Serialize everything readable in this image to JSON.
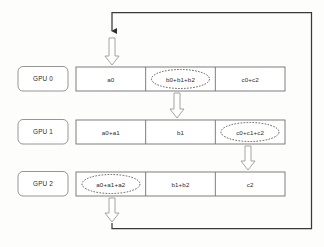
{
  "diagram": {
    "background_color": "#fdfdfc",
    "line_color": "#3a3a3a",
    "box_border_color": "#8a8a8a",
    "text_color": "#2b2b2b",
    "rows": [
      {
        "gpu_label": "GPU 0",
        "cells": [
          {
            "text": "a0",
            "highlighted": false
          },
          {
            "text": "b0+b1+b2",
            "highlighted": true
          },
          {
            "text": "c0+c2",
            "highlighted": false
          }
        ]
      },
      {
        "gpu_label": "GPU 1",
        "cells": [
          {
            "text": "a0+a1",
            "highlighted": false
          },
          {
            "text": "b1",
            "highlighted": false
          },
          {
            "text": "c0+c1+c2",
            "highlighted": true
          }
        ]
      },
      {
        "gpu_label": "GPU 2",
        "cells": [
          {
            "text": "a0+a1+a2",
            "highlighted": true
          },
          {
            "text": "b1+b2",
            "highlighted": false
          },
          {
            "text": "c2",
            "highlighted": false
          }
        ]
      }
    ],
    "arrows": [
      {
        "name": "block-arrow-into-gpu0",
        "x": 112,
        "y_top": 38,
        "y_bottom": 64
      },
      {
        "name": "block-arrow-gpu0-to-gpu1",
        "x": 177,
        "y_top": 93,
        "y_bottom": 118
      },
      {
        "name": "block-arrow-gpu1-to-gpu2",
        "x": 248,
        "y_top": 146,
        "y_bottom": 170
      },
      {
        "name": "block-arrow-gpu2-to-loop",
        "x": 112,
        "y_top": 198,
        "y_bottom": 222
      }
    ],
    "feedback_loop": {
      "name": "ring-feedback-loop",
      "path": "M112,222 L112,228 L312,228 L312,12 L112,12 L112,32",
      "arrowhead": "solid-down"
    }
  }
}
